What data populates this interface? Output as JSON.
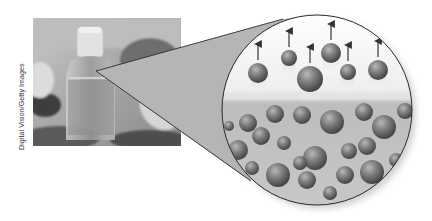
{
  "figure": {
    "credit": "Digital Vision/Getty Images",
    "photo": {
      "subject": "glass perfume bottle",
      "x": 33,
      "y": 18,
      "width": 148,
      "height": 128
    },
    "magnifier": {
      "apex": [
        96,
        71
      ],
      "cone_fill": "#b5b5b5",
      "circle": {
        "cx": 317,
        "cy": 110,
        "r": 95
      },
      "liquid_surface_y": 97,
      "vapor_color": "#f4f4f4",
      "liquid_color": "#c4c4c4"
    },
    "vapor_particles": [
      {
        "cx": 258,
        "cy": 73,
        "r": 10
      },
      {
        "cx": 289,
        "cy": 58,
        "r": 8
      },
      {
        "cx": 310,
        "cy": 79,
        "r": 13
      },
      {
        "cx": 331,
        "cy": 53,
        "r": 10
      },
      {
        "cx": 348,
        "cy": 72,
        "r": 8
      },
      {
        "cx": 378,
        "cy": 70,
        "r": 10
      }
    ],
    "liquid_particles": [
      {
        "cx": 229,
        "cy": 126,
        "r": 5
      },
      {
        "cx": 248,
        "cy": 123,
        "r": 9
      },
      {
        "cx": 275,
        "cy": 114,
        "r": 9
      },
      {
        "cx": 302,
        "cy": 115,
        "r": 9
      },
      {
        "cx": 332,
        "cy": 122,
        "r": 12
      },
      {
        "cx": 364,
        "cy": 112,
        "r": 9
      },
      {
        "cx": 384,
        "cy": 127,
        "r": 12
      },
      {
        "cx": 405,
        "cy": 111,
        "r": 8
      },
      {
        "cx": 238,
        "cy": 150,
        "r": 10
      },
      {
        "cx": 261,
        "cy": 136,
        "r": 9
      },
      {
        "cx": 284,
        "cy": 143,
        "r": 7
      },
      {
        "cx": 315,
        "cy": 158,
        "r": 12
      },
      {
        "cx": 349,
        "cy": 151,
        "r": 8
      },
      {
        "cx": 367,
        "cy": 146,
        "r": 9
      },
      {
        "cx": 396,
        "cy": 160,
        "r": 7
      },
      {
        "cx": 252,
        "cy": 168,
        "r": 7
      },
      {
        "cx": 278,
        "cy": 175,
        "r": 12
      },
      {
        "cx": 300,
        "cy": 163,
        "r": 7
      },
      {
        "cx": 307,
        "cy": 180,
        "r": 9
      },
      {
        "cx": 345,
        "cy": 175,
        "r": 9
      },
      {
        "cx": 372,
        "cy": 172,
        "r": 12
      },
      {
        "cx": 330,
        "cy": 193,
        "r": 7
      },
      {
        "cx": 388,
        "cy": 188,
        "r": 6
      }
    ],
    "arrow_length": 16
  }
}
